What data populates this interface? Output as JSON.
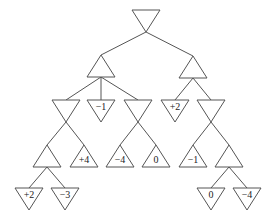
{
  "diagram": {
    "type": "game-tree",
    "colors": {
      "stroke": "#555555",
      "background": "#ffffff",
      "text": "#222222"
    },
    "nodes": [
      {
        "id": "root",
        "kind": "min",
        "cx": 146,
        "y": 10,
        "label": ""
      },
      {
        "id": "L",
        "kind": "max",
        "cx": 101,
        "y": 55,
        "label": ""
      },
      {
        "id": "R",
        "kind": "max",
        "cx": 193,
        "y": 56,
        "label": ""
      },
      {
        "id": "LA",
        "kind": "min",
        "cx": 66,
        "y": 100,
        "label": ""
      },
      {
        "id": "LB",
        "kind": "min",
        "cx": 101,
        "y": 100,
        "label": "−1"
      },
      {
        "id": "LC",
        "kind": "min",
        "cx": 138,
        "y": 100,
        "label": ""
      },
      {
        "id": "RA",
        "kind": "min",
        "cx": 175,
        "y": 100,
        "label": "+2"
      },
      {
        "id": "RB",
        "kind": "min",
        "cx": 211,
        "y": 100,
        "label": ""
      },
      {
        "id": "LAa",
        "kind": "max",
        "cx": 47,
        "y": 145,
        "label": ""
      },
      {
        "id": "LAb",
        "kind": "max",
        "cx": 84,
        "y": 145,
        "label": "+4"
      },
      {
        "id": "LCa",
        "kind": "max",
        "cx": 120,
        "y": 145,
        "label": "−4"
      },
      {
        "id": "LCb",
        "kind": "max",
        "cx": 156,
        "y": 145,
        "label": "0"
      },
      {
        "id": "RBa",
        "kind": "max",
        "cx": 193,
        "y": 145,
        "label": "−1"
      },
      {
        "id": "RBb",
        "kind": "max",
        "cx": 229,
        "y": 145,
        "label": ""
      },
      {
        "id": "LAa1",
        "kind": "min",
        "cx": 29,
        "y": 188,
        "label": "+2"
      },
      {
        "id": "LAa2",
        "kind": "min",
        "cx": 65,
        "y": 188,
        "label": "−3"
      },
      {
        "id": "RBb1",
        "kind": "min",
        "cx": 211,
        "y": 188,
        "label": "0"
      },
      {
        "id": "RBb2",
        "kind": "min",
        "cx": 247,
        "y": 188,
        "label": "−4"
      }
    ],
    "edges": [
      [
        "root",
        "L"
      ],
      [
        "root",
        "R"
      ],
      [
        "L",
        "LA"
      ],
      [
        "L",
        "LB"
      ],
      [
        "L",
        "LC"
      ],
      [
        "R",
        "RA"
      ],
      [
        "R",
        "RB"
      ],
      [
        "LA",
        "LAa"
      ],
      [
        "LA",
        "LAb"
      ],
      [
        "LC",
        "LCa"
      ],
      [
        "LC",
        "LCb"
      ],
      [
        "RB",
        "RBa"
      ],
      [
        "RB",
        "RBb"
      ],
      [
        "LAa",
        "LAa1"
      ],
      [
        "LAa",
        "LAa2"
      ],
      [
        "RBb",
        "RBb1"
      ],
      [
        "RBb",
        "RBb2"
      ]
    ],
    "leaf_values": [
      "−1",
      "+2",
      "+4",
      "−4",
      "0",
      "−1",
      "+2",
      "−3",
      "0",
      "−4"
    ]
  }
}
